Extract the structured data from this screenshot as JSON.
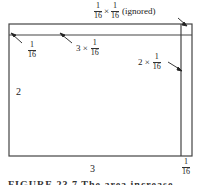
{
  "figure": {
    "outer_dimensions": {
      "width_label": "3",
      "height_label": "2"
    },
    "labels": {
      "top_left_strip": {
        "num": "1",
        "den": "16"
      },
      "top_strip": {
        "prefix": "3 ×",
        "num": "1",
        "den": "16"
      },
      "right_strip": {
        "prefix": "2 ×",
        "num": "1",
        "den": "16"
      },
      "corner": {
        "num1": "1",
        "den1": "16",
        "times": "×",
        "num2": "1",
        "den2": "16",
        "suffix": "(ignored)"
      },
      "bottom_right": {
        "num": "1",
        "den": "16"
      },
      "width": "3",
      "height": "2"
    },
    "caption": "FIGURE 23.7  The area increase"
  },
  "colors": {
    "line": "#444444",
    "background": "#ffffff",
    "text": "#222222"
  }
}
